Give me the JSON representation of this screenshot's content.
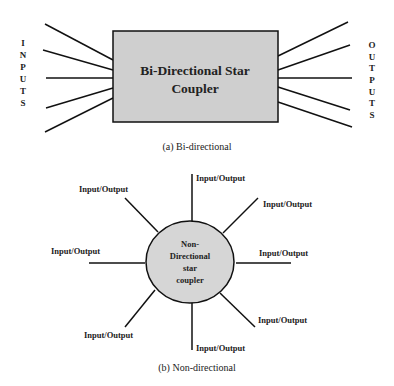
{
  "diagram_a": {
    "box_label_line1": "Bi-Directional Star",
    "box_label_line2": "Coupler",
    "inputs_letters": [
      "I",
      "N",
      "P",
      "U",
      "T",
      "S"
    ],
    "outputs_letters": [
      "O",
      "U",
      "T",
      "P",
      "U",
      "T",
      "S"
    ],
    "caption": "(a) Bi-directional",
    "box_fill": "#cfcfcf"
  },
  "diagram_b": {
    "center_line1": "Non-",
    "center_line2": "Directional",
    "center_line3": "star",
    "center_line4": "coupler",
    "port_label": "Input/Output",
    "ports": [
      "Input/Output",
      "Input/Output",
      "Input/Output",
      "Input/Output",
      "Input/Output",
      "Input/Output",
      "Input/Output",
      "Input/Output"
    ],
    "caption": "(b) Non-directional",
    "circle_fill": "#d6d6d6"
  }
}
